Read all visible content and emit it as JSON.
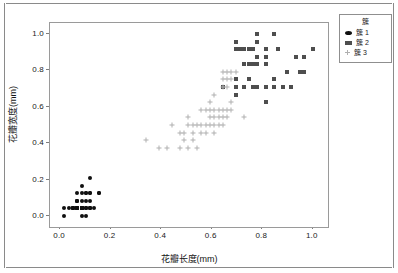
{
  "chart_data": {
    "type": "scatter",
    "title": "",
    "xlabel": "花瓣长度(mm)",
    "ylabel": "花瓣宽度(mm)",
    "xlim": [
      -0.04,
      1.06
    ],
    "ylim": [
      -0.06,
      1.06
    ],
    "xticks": [
      "0.0",
      "0.2",
      "0.4",
      "0.6",
      "0.8",
      "1.0"
    ],
    "xtick_values": [
      0.0,
      0.2,
      0.4,
      0.6,
      0.8,
      1.0
    ],
    "yticks": [
      "0.0",
      "0.2",
      "0.4",
      "0.6",
      "0.8",
      "1.0"
    ],
    "ytick_values": [
      0.0,
      0.2,
      0.4,
      0.6,
      0.8,
      1.0
    ],
    "grid": false,
    "legend_position": "upper-right-outside",
    "legend_title": "簇",
    "series": [
      {
        "name": "簇 1",
        "marker": "filled-circle",
        "color": "#101010",
        "points": [
          [
            0.068,
            0.042
          ],
          [
            0.102,
            0.042
          ],
          [
            0.051,
            0.042
          ],
          [
            0.085,
            0.042
          ],
          [
            0.068,
            0.042
          ],
          [
            0.119,
            0.125
          ],
          [
            0.068,
            0.083
          ],
          [
            0.085,
            0.042
          ],
          [
            0.085,
            0.042
          ],
          [
            0.102,
            0.0
          ],
          [
            0.085,
            0.042
          ],
          [
            0.102,
            0.083
          ],
          [
            0.085,
            0.0
          ],
          [
            0.017,
            0.0
          ],
          [
            0.034,
            0.042
          ],
          [
            0.085,
            0.167
          ],
          [
            0.068,
            0.125
          ],
          [
            0.068,
            0.083
          ],
          [
            0.119,
            0.083
          ],
          [
            0.085,
            0.083
          ],
          [
            0.119,
            0.042
          ],
          [
            0.085,
            0.125
          ],
          [
            0.017,
            0.042
          ],
          [
            0.119,
            0.208
          ],
          [
            0.153,
            0.125
          ],
          [
            0.119,
            0.042
          ],
          [
            0.119,
            0.125
          ],
          [
            0.085,
            0.042
          ],
          [
            0.068,
            0.042
          ],
          [
            0.136,
            0.042
          ],
          [
            0.119,
            0.042
          ],
          [
            0.102,
            0.125
          ],
          [
            0.085,
            0.042
          ],
          [
            0.068,
            0.042
          ],
          [
            0.102,
            0.042
          ],
          [
            0.051,
            0.042
          ],
          [
            0.068,
            0.042
          ],
          [
            0.085,
            0.042
          ],
          [
            0.051,
            0.042
          ],
          [
            0.085,
            0.042
          ],
          [
            0.068,
            0.083
          ],
          [
            0.051,
            0.042
          ],
          [
            0.051,
            0.042
          ],
          [
            0.102,
            0.125
          ],
          [
            0.153,
            0.125
          ],
          [
            0.068,
            0.042
          ],
          [
            0.102,
            0.042
          ],
          [
            0.068,
            0.042
          ],
          [
            0.085,
            0.042
          ],
          [
            0.068,
            0.042
          ]
        ]
      },
      {
        "name": "簇 2",
        "marker": "filled-square",
        "color": "#4e4e4e",
        "points": [
          [
            0.695,
            0.917
          ],
          [
            0.695,
            0.958
          ],
          [
            0.78,
            1.0
          ],
          [
            0.847,
            1.0
          ],
          [
            0.729,
            0.917
          ],
          [
            0.78,
            0.958
          ],
          [
            0.814,
            0.917
          ],
          [
            0.864,
            0.917
          ],
          [
            0.746,
            0.917
          ],
          [
            0.712,
            0.917
          ],
          [
            0.763,
            0.917
          ],
          [
            0.695,
            0.75
          ],
          [
            0.746,
            0.75
          ],
          [
            0.78,
            0.875
          ],
          [
            0.814,
            0.875
          ],
          [
            0.746,
            0.833
          ],
          [
            0.78,
            0.833
          ],
          [
            0.814,
            0.833
          ],
          [
            0.847,
            0.75
          ],
          [
            0.763,
            0.833
          ],
          [
            0.729,
            0.833
          ],
          [
            0.898,
            0.792
          ],
          [
            0.949,
            0.792
          ],
          [
            0.966,
            0.875
          ],
          [
            1.0,
            0.917
          ],
          [
            0.932,
            0.875
          ],
          [
            0.881,
            0.708
          ],
          [
            0.847,
            0.708
          ],
          [
            0.814,
            0.708
          ],
          [
            0.78,
            0.708
          ],
          [
            0.763,
            0.708
          ],
          [
            0.695,
            0.667
          ],
          [
            0.814,
            0.625
          ],
          [
            0.729,
            0.708
          ],
          [
            0.695,
            0.708
          ],
          [
            0.644,
            0.708
          ],
          [
            0.915,
            0.708
          ],
          [
            0.966,
            0.792
          ]
        ]
      },
      {
        "name": "簇 3",
        "marker": "plus",
        "color": "#b0b0b0",
        "points": [
          [
            0.339,
            0.417
          ],
          [
            0.39,
            0.375
          ],
          [
            0.424,
            0.375
          ],
          [
            0.441,
            0.5
          ],
          [
            0.475,
            0.375
          ],
          [
            0.492,
            0.417
          ],
          [
            0.508,
            0.375
          ],
          [
            0.525,
            0.417
          ],
          [
            0.542,
            0.375
          ],
          [
            0.475,
            0.458
          ],
          [
            0.492,
            0.458
          ],
          [
            0.508,
            0.542
          ],
          [
            0.525,
            0.458
          ],
          [
            0.559,
            0.458
          ],
          [
            0.576,
            0.458
          ],
          [
            0.61,
            0.458
          ],
          [
            0.508,
            0.5
          ],
          [
            0.525,
            0.5
          ],
          [
            0.542,
            0.5
          ],
          [
            0.559,
            0.5
          ],
          [
            0.576,
            0.5
          ],
          [
            0.593,
            0.5
          ],
          [
            0.61,
            0.5
          ],
          [
            0.627,
            0.5
          ],
          [
            0.644,
            0.5
          ],
          [
            0.593,
            0.542
          ],
          [
            0.61,
            0.542
          ],
          [
            0.627,
            0.542
          ],
          [
            0.644,
            0.542
          ],
          [
            0.661,
            0.542
          ],
          [
            0.729,
            0.542
          ],
          [
            0.576,
            0.583
          ],
          [
            0.593,
            0.583
          ],
          [
            0.61,
            0.583
          ],
          [
            0.627,
            0.583
          ],
          [
            0.644,
            0.583
          ],
          [
            0.661,
            0.583
          ],
          [
            0.678,
            0.583
          ],
          [
            0.559,
            0.583
          ],
          [
            0.593,
            0.625
          ],
          [
            0.61,
            0.667
          ],
          [
            0.678,
            0.625
          ],
          [
            0.644,
            0.708
          ],
          [
            0.661,
            0.708
          ],
          [
            0.644,
            0.75
          ],
          [
            0.661,
            0.75
          ],
          [
            0.678,
            0.75
          ],
          [
            0.644,
            0.792
          ],
          [
            0.661,
            0.792
          ],
          [
            0.678,
            0.792
          ],
          [
            0.695,
            0.792
          ]
        ]
      }
    ]
  },
  "legend": {
    "title": "簇",
    "entries": [
      {
        "label": "簇 1",
        "marker": "filled-circle"
      },
      {
        "label": "簇 2",
        "marker": "filled-square"
      },
      {
        "label": "簇 3",
        "marker": "plus"
      }
    ]
  },
  "axes": {
    "x_title": "花瓣长度(mm)",
    "y_title": "花瓣宽度(mm)"
  },
  "colors": {
    "cluster1": "#101010",
    "cluster2": "#4e4e4e",
    "cluster3": "#b0b0b0",
    "frame": "#9a9a9a",
    "text": "#1a1a1a",
    "background": "#ffffff"
  }
}
